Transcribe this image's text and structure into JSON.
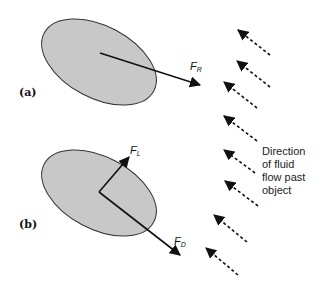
{
  "panels": [
    {
      "label": "(a)",
      "forces": [
        {
          "symbol": "F",
          "subscript": "R",
          "name": "resultant force"
        }
      ]
    },
    {
      "label": "(b)",
      "forces": [
        {
          "symbol": "F",
          "subscript": "L",
          "name": "lift force"
        },
        {
          "symbol": "F",
          "subscript": "D",
          "name": "drag force"
        }
      ]
    }
  ],
  "caption": {
    "line1": "Direction",
    "line2": "of fluid",
    "line3": "flow past",
    "line4": "object"
  },
  "colors": {
    "object_fill": "#c8c8c8",
    "stroke": "#111111"
  }
}
